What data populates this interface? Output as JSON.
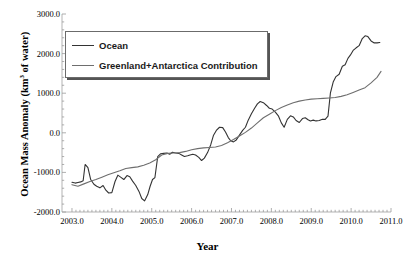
{
  "chart_data": {
    "type": "line",
    "title": "",
    "xlabel": "Year",
    "ylabel": "Ocean Mass Anomaly (km",
    "ylabel_sup": "3",
    "ylabel_tail": " of water)",
    "xlim": [
      2002.75,
      2011.0
    ],
    "ylim": [
      -2000.0,
      3000.0
    ],
    "grid": false,
    "legend_position": "upper-left",
    "xticks": [
      2003.0,
      2004.0,
      2005.0,
      2006.0,
      2007.0,
      2008.0,
      2009.0,
      2010.0,
      2011.0
    ],
    "xtick_labels": [
      "2003.0",
      "2004.0",
      "2005.0",
      "2006.0",
      "2007.0",
      "2008.0",
      "2009.0",
      "2010.0",
      "2011.0"
    ],
    "yticks": [
      -2000.0,
      -1000.0,
      0.0,
      1000.0,
      2000.0,
      3000.0
    ],
    "ytick_labels": [
      "-2000.0",
      "-1000.0",
      "0.0",
      "1000.0",
      "2000.0",
      "3000.0"
    ],
    "series": [
      {
        "name": "Ocean",
        "color": "#333333",
        "width": 1.1,
        "x": [
          2003.0,
          2003.08,
          2003.15,
          2003.22,
          2003.28,
          2003.33,
          2003.4,
          2003.47,
          2003.55,
          2003.62,
          2003.7,
          2003.78,
          2003.85,
          2003.92,
          2004.0,
          2004.08,
          2004.15,
          2004.22,
          2004.3,
          2004.38,
          2004.45,
          2004.52,
          2004.6,
          2004.68,
          2004.75,
          2004.82,
          2004.9,
          2004.96,
          2005.02,
          2005.08,
          2005.15,
          2005.22,
          2005.3,
          2005.38,
          2005.45,
          2005.52,
          2005.6,
          2005.68,
          2005.75,
          2005.82,
          2005.9,
          2005.96,
          2006.03,
          2006.1,
          2006.18,
          2006.25,
          2006.32,
          2006.4,
          2006.48,
          2006.55,
          2006.62,
          2006.7,
          2006.78,
          2006.85,
          2006.92,
          2006.98,
          2007.05,
          2007.12,
          2007.2,
          2007.28,
          2007.35,
          2007.42,
          2007.5,
          2007.58,
          2007.65,
          2007.72,
          2007.8,
          2007.88,
          2007.95,
          2008.02,
          2008.1,
          2008.18,
          2008.25,
          2008.32,
          2008.4,
          2008.48,
          2008.55,
          2008.62,
          2008.7,
          2008.78,
          2008.85,
          2008.92,
          2008.98,
          2009.05,
          2009.12,
          2009.2,
          2009.28,
          2009.35,
          2009.42,
          2009.48,
          2009.55,
          2009.62,
          2009.7,
          2009.78,
          2009.85,
          2009.92,
          2009.98,
          2010.05,
          2010.12,
          2010.2,
          2010.28,
          2010.35,
          2010.42,
          2010.5,
          2010.58,
          2010.65,
          2010.72
        ],
        "y": [
          -1250,
          -1270,
          -1255,
          -1240,
          -1210,
          -800,
          -880,
          -1180,
          -1300,
          -1350,
          -1390,
          -1330,
          -1450,
          -1520,
          -1510,
          -1230,
          -1070,
          -1120,
          -1180,
          -1080,
          -1110,
          -1220,
          -1330,
          -1480,
          -1660,
          -1720,
          -1560,
          -1350,
          -1180,
          -1130,
          -600,
          -530,
          -520,
          -510,
          -540,
          -490,
          -510,
          -520,
          -560,
          -600,
          -580,
          -560,
          -540,
          -560,
          -620,
          -700,
          -640,
          -500,
          -300,
          -60,
          60,
          140,
          130,
          20,
          -120,
          -200,
          -230,
          -180,
          -60,
          60,
          140,
          320,
          480,
          620,
          730,
          790,
          760,
          690,
          620,
          600,
          520,
          420,
          250,
          140,
          340,
          430,
          400,
          310,
          260,
          360,
          380,
          330,
          300,
          320,
          300,
          310,
          340,
          340,
          420,
          1000,
          1280,
          1420,
          1480,
          1680,
          1720,
          1880,
          1960,
          2080,
          2140,
          2200,
          2380,
          2450,
          2430,
          2320,
          2270,
          2270,
          2280
        ]
      },
      {
        "name": "Greenland+Antarctica Contribution",
        "color": "#6e6e6e",
        "width": 1.1,
        "x": [
          2003.0,
          2003.15,
          2003.3,
          2003.45,
          2003.6,
          2003.75,
          2003.9,
          2004.05,
          2004.2,
          2004.35,
          2004.5,
          2004.65,
          2004.8,
          2004.95,
          2005.1,
          2005.25,
          2005.4,
          2005.55,
          2005.7,
          2005.85,
          2006.0,
          2006.15,
          2006.3,
          2006.45,
          2006.6,
          2006.75,
          2006.9,
          2007.05,
          2007.2,
          2007.35,
          2007.5,
          2007.65,
          2007.8,
          2007.95,
          2008.1,
          2008.25,
          2008.4,
          2008.55,
          2008.7,
          2008.85,
          2009.0,
          2009.15,
          2009.3,
          2009.45,
          2009.6,
          2009.75,
          2009.9,
          2010.05,
          2010.2,
          2010.35,
          2010.5,
          2010.65,
          2010.75
        ],
        "y": [
          -1310,
          -1350,
          -1290,
          -1230,
          -1180,
          -1120,
          -1060,
          -1010,
          -960,
          -900,
          -880,
          -860,
          -820,
          -760,
          -680,
          -560,
          -520,
          -510,
          -500,
          -470,
          -430,
          -400,
          -380,
          -370,
          -360,
          -320,
          -250,
          -170,
          -80,
          10,
          120,
          250,
          380,
          470,
          560,
          640,
          700,
          760,
          800,
          830,
          850,
          860,
          870,
          880,
          890,
          920,
          960,
          1020,
          1080,
          1140,
          1260,
          1400,
          1550
        ]
      }
    ]
  },
  "legend": {
    "items": [
      {
        "label": "Ocean",
        "color": "#333333"
      },
      {
        "label": "Greenland+Antarctica Contribution",
        "color": "#6e6e6e"
      }
    ]
  }
}
